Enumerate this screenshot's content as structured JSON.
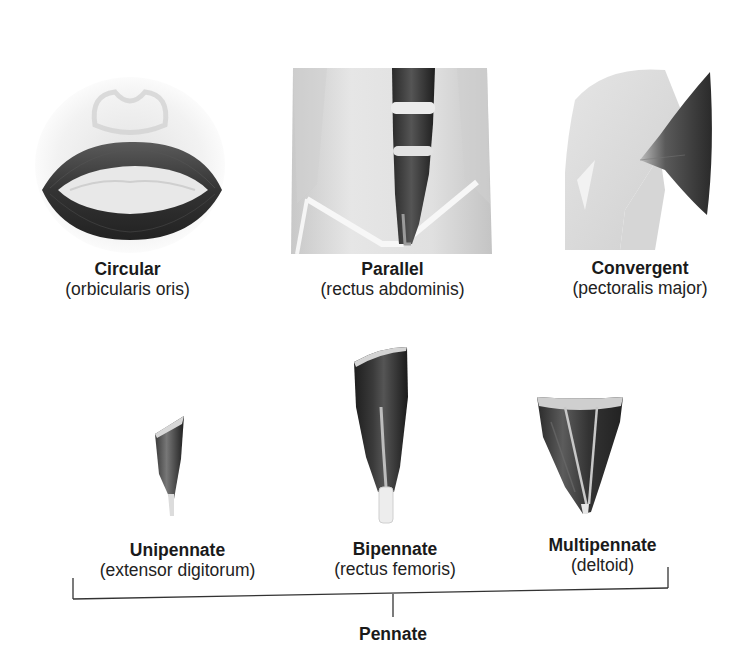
{
  "diagram": {
    "top_row": [
      {
        "name": "Circular",
        "muscle": "(orbicularis oris)",
        "icon": "orbicularis-oris-illustration"
      },
      {
        "name": "Parallel",
        "muscle": "(rectus abdominis)",
        "icon": "rectus-abdominis-illustration"
      },
      {
        "name": "Convergent",
        "muscle": "(pectoralis major)",
        "icon": "pectoralis-major-illustration"
      }
    ],
    "bottom_row": [
      {
        "name": "Unipennate",
        "muscle": "(extensor digitorum)",
        "icon": "extensor-digitorum-illustration"
      },
      {
        "name": "Bipennate",
        "muscle": "(rectus femoris)",
        "icon": "rectus-femoris-illustration"
      },
      {
        "name": "Multipennate",
        "muscle": "(deltoid)",
        "icon": "deltoid-illustration"
      }
    ],
    "group_label": "Pennate",
    "colors": {
      "muscle_dark": "#2b2b2b",
      "tissue_light": "#d9d9d9",
      "tendon": "#f0f0f0",
      "line": "#333333"
    }
  }
}
